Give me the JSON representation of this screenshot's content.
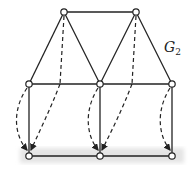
{
  "diagram": {
    "label": "G",
    "label_sub": "2",
    "nodes": {
      "top": [
        [
          64,
          12
        ],
        [
          136,
          12
        ]
      ],
      "middle": [
        [
          29,
          84
        ],
        [
          100,
          84
        ],
        [
          172,
          84
        ]
      ],
      "bottom": [
        [
          29,
          156
        ],
        [
          100,
          156
        ],
        [
          172,
          156
        ]
      ]
    },
    "colors": {
      "edge": "#222222",
      "band": "#e6e6e6",
      "node_fill": "#ffffff"
    }
  }
}
